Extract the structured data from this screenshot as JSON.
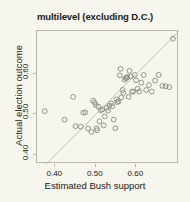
{
  "chart_data": {
    "type": "scatter",
    "title": "multilevel (excluding D.C.)",
    "xlabel": "Estimated Bush support",
    "ylabel": "Actual election outcome",
    "xlim": [
      0.355,
      0.705
    ],
    "ylim": [
      0.378,
      0.705
    ],
    "xticks": [
      0.4,
      0.5,
      0.6
    ],
    "yticks": [
      0.4,
      0.5,
      0.6
    ],
    "xticklabels": [
      "0.40",
      "0.50",
      "0.60"
    ],
    "yticklabels": [
      "0.40",
      "0.50",
      "0.60"
    ],
    "grid": false,
    "legend": null,
    "marker": "open-circle",
    "marker_color": "#8a8a80",
    "reference_line": {
      "name": "identity-line",
      "type": "y=x",
      "slope": 1,
      "intercept": 0,
      "color": "#c2c0b2"
    },
    "x": [
      0.374,
      0.423,
      0.444,
      0.45,
      0.463,
      0.469,
      0.474,
      0.481,
      0.489,
      0.493,
      0.497,
      0.5,
      0.502,
      0.503,
      0.506,
      0.509,
      0.512,
      0.516,
      0.519,
      0.522,
      0.527,
      0.53,
      0.534,
      0.538,
      0.541,
      0.544,
      0.548,
      0.551,
      0.553,
      0.556,
      0.559,
      0.561,
      0.563,
      0.566,
      0.568,
      0.571,
      0.573,
      0.576,
      0.578,
      0.581,
      0.583,
      0.586,
      0.589,
      0.592,
      0.596,
      0.599,
      0.603,
      0.607,
      0.612,
      0.618,
      0.624,
      0.631,
      0.638,
      0.646,
      0.655,
      0.664,
      0.672,
      0.681,
      0.69
    ],
    "y": [
      0.508,
      0.487,
      0.543,
      0.471,
      0.47,
      0.504,
      0.505,
      0.465,
      0.457,
      0.534,
      0.529,
      0.523,
      0.466,
      0.461,
      0.519,
      0.483,
      0.51,
      0.512,
      0.473,
      0.495,
      0.516,
      0.509,
      0.522,
      0.527,
      0.52,
      0.487,
      0.466,
      0.537,
      0.53,
      0.532,
      0.596,
      0.612,
      0.542,
      0.56,
      0.553,
      0.585,
      0.589,
      0.59,
      0.592,
      0.543,
      0.607,
      0.593,
      0.556,
      0.556,
      0.597,
      0.584,
      0.563,
      0.556,
      0.578,
      0.597,
      0.56,
      0.572,
      0.556,
      0.583,
      0.597,
      0.57,
      0.569,
      0.567,
      0.686
    ]
  }
}
